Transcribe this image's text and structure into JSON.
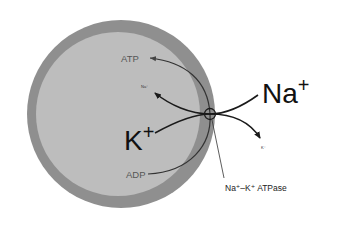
{
  "diagram": {
    "colors": {
      "background": "#ffffff",
      "membrane": "#8f8f8f",
      "cytoplasm": "#bdbdbd",
      "lines": "#1a1a1a",
      "label_gray": "#555555"
    },
    "labels": {
      "atp": "ATP",
      "adp": "ADP",
      "na_inside": "Na⁺",
      "k_inside_main": "K",
      "k_inside_plus": "+",
      "na_outside_main": "Na",
      "na_outside_plus": "+",
      "k_outside": "K⁺",
      "pump": "Na⁺–K⁺ ATPase"
    }
  }
}
